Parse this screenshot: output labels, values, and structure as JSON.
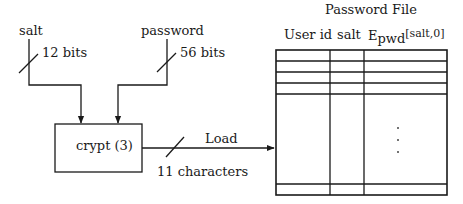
{
  "diagram": {
    "inputs": {
      "salt": {
        "label": "salt",
        "width": "12 bits"
      },
      "password": {
        "label": "password",
        "width": "56 bits"
      }
    },
    "process": {
      "label": "crypt (3)"
    },
    "output": {
      "label": "Load",
      "width": "11 characters"
    },
    "password_file": {
      "title": "Password File",
      "columns": [
        {
          "label": "User id"
        },
        {
          "label": "salt"
        },
        {
          "label_main": "E",
          "label_sub": "pwd",
          "label_sup": "[salt,0]"
        }
      ],
      "ellipsis": "⋮"
    }
  }
}
